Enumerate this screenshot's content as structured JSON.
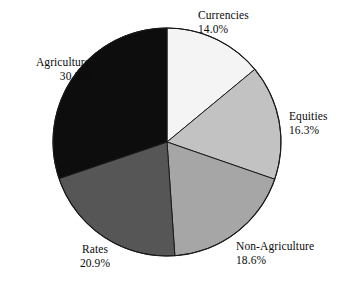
{
  "chart_data": {
    "type": "pie",
    "title": "",
    "subtitle": "",
    "xlabel": "",
    "ylabel": "",
    "legend_position": "none",
    "grid": false,
    "labels_inline": true,
    "start_angle_deg": 0,
    "direction": "clockwise",
    "categories": [
      "Currencies",
      "Equities",
      "Non-Agriculture",
      "Rates",
      "Agriculture"
    ],
    "values": [
      14.0,
      16.3,
      18.6,
      20.9,
      30.2
    ],
    "value_unit": "%",
    "slices": [
      {
        "name": "Currencies",
        "label": "Currencies",
        "value": 14.0,
        "value_text": "14.0%",
        "color": "#f4f4f4",
        "start_deg": 0.0,
        "end_deg": 50.4
      },
      {
        "name": "Equities",
        "label": "Equities",
        "value": 16.3,
        "value_text": "16.3%",
        "color": "#c2c2c2",
        "start_deg": 50.4,
        "end_deg": 109.08
      },
      {
        "name": "Non-Agriculture",
        "label": "Non-Agriculture",
        "value": 18.6,
        "value_text": "18.6%",
        "color": "#a6a6a6",
        "start_deg": 109.08,
        "end_deg": 176.04
      },
      {
        "name": "Rates",
        "label": "Rates",
        "value": 20.9,
        "value_text": "20.9%",
        "color": "#565656",
        "start_deg": 176.04,
        "end_deg": 251.28
      },
      {
        "name": "Agriculture",
        "label": "Agriculture",
        "value": 30.2,
        "value_text": "30.2%",
        "color": "#0d0d0d",
        "start_deg": 251.28,
        "end_deg": 360.0
      }
    ],
    "geometry": {
      "center_x": 167,
      "center_y": 142,
      "radius": 114
    },
    "colors": {
      "background": "#ffffff",
      "outline": "#1a1a1a",
      "text": "#0a0a0a"
    }
  }
}
